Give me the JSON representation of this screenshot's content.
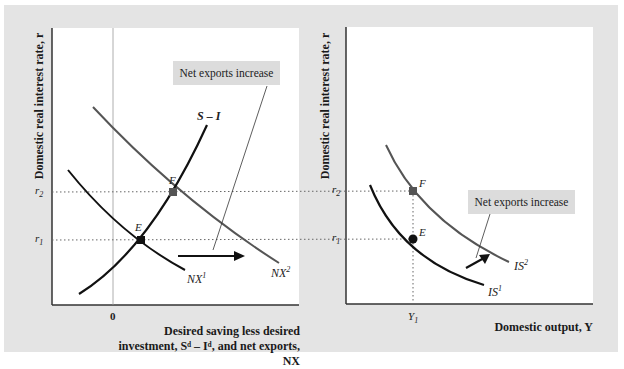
{
  "left_panel": {
    "y_axis_label": "Domestic real interest rate, r",
    "x_axis_label_line1": "Desired saving less desired",
    "x_axis_label_line2": "investment, Sᵈ – Iᵈ, and net exports, NX",
    "zero_tick": "0",
    "r2_tick": "r",
    "r2_sub": "2",
    "r1_tick": "r",
    "r1_sub": "1",
    "callout": "Net exports increase",
    "curves": {
      "s_minus_i": "S – I",
      "nx1": "NX",
      "nx1_sup": "1",
      "nx2": "NX",
      "nx2_sup": "2"
    },
    "points": {
      "e": "E",
      "f": "F"
    }
  },
  "right_panel": {
    "y_axis_label": "Domestic real interest rate, r",
    "x_axis_label": "Domestic output, Y",
    "y1_tick": "Y",
    "y1_sub": "1",
    "r2_tick": "r",
    "r2_sub": "2",
    "r1_tick": "r",
    "r1_sub": "1",
    "callout": "Net exports increase",
    "curves": {
      "is1": "IS",
      "is1_sup": "1",
      "is2": "IS",
      "is2_sup": "2"
    },
    "points": {
      "e": "E",
      "f": "F"
    }
  },
  "colors": {
    "frame": "#e4e4e4",
    "curve_dark": "#111111",
    "curve_shifted": "#555555",
    "callout_bg": "#dcdcdc"
  }
}
